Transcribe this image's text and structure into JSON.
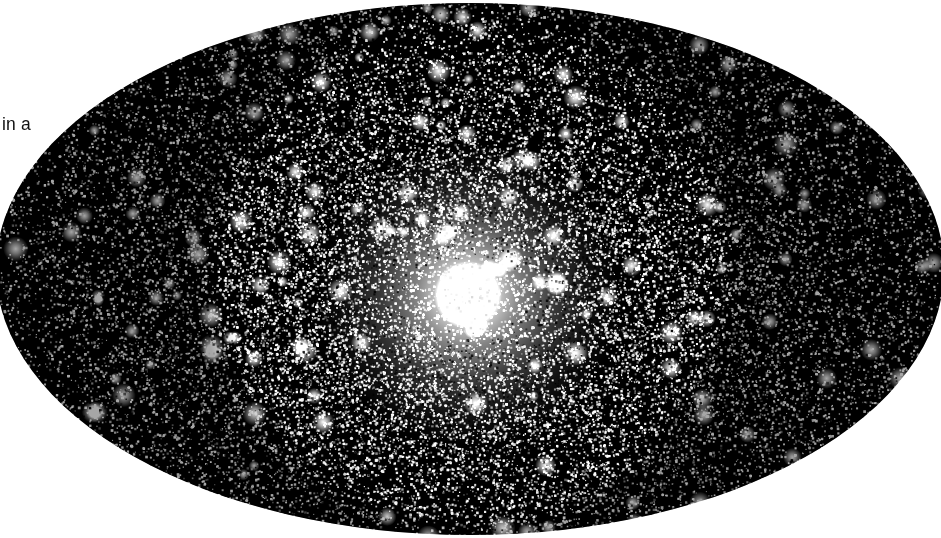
{
  "page": {
    "width": 941,
    "height": 538,
    "background_color": "#ffffff"
  },
  "body_text": {
    "fragment": "in a",
    "color": "#111111",
    "x": 2,
    "y": 113
  },
  "figure": {
    "name": "globular-star-cluster-photograph",
    "shape": "ellipse",
    "background_color": "#000000",
    "star_color": "#ffffff",
    "core_color": "#ffffff",
    "ellipse": {
      "center_x": 470,
      "center_y": 266,
      "radius_x": 474,
      "radius_y": 266
    },
    "core": {
      "center_x": 468,
      "center_y": 292,
      "saturated_radius": 34,
      "glow_radius": 150
    },
    "star_counts": {
      "fine_grain": 52000,
      "resolved_stars": 5200,
      "bright_stars": 240
    },
    "texture": "halftone-dither"
  }
}
